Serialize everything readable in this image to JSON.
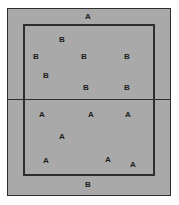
{
  "figure": {
    "background_color": "#ffffff",
    "fill_color": "#a9a9a9",
    "line_color": "#2e2e2e",
    "text_color": "#1d1d1d",
    "outer_rect": {
      "x": 7,
      "y": 8,
      "w": 164,
      "h": 188
    },
    "inner_rect": {
      "x": 23,
      "y": 24,
      "w": 132,
      "h": 152
    },
    "divider": {
      "x": 7,
      "y": 99,
      "w": 164
    }
  },
  "labels": [
    {
      "text": "A",
      "x": 88,
      "y": 17,
      "region": "outside-top"
    },
    {
      "text": "B",
      "x": 62,
      "y": 40,
      "region": "inner-upper"
    },
    {
      "text": "B",
      "x": 36,
      "y": 57,
      "region": "inner-upper"
    },
    {
      "text": "B",
      "x": 84,
      "y": 57,
      "region": "inner-upper"
    },
    {
      "text": "B",
      "x": 127,
      "y": 57,
      "region": "inner-upper"
    },
    {
      "text": "B",
      "x": 46,
      "y": 76,
      "region": "inner-upper"
    },
    {
      "text": "B",
      "x": 86,
      "y": 88,
      "region": "inner-upper"
    },
    {
      "text": "B",
      "x": 127,
      "y": 88,
      "region": "inner-upper"
    },
    {
      "text": "A",
      "x": 42,
      "y": 115,
      "region": "inner-lower"
    },
    {
      "text": "A",
      "x": 91,
      "y": 115,
      "region": "inner-lower"
    },
    {
      "text": "A",
      "x": 128,
      "y": 115,
      "region": "inner-lower"
    },
    {
      "text": "A",
      "x": 62,
      "y": 137,
      "region": "inner-lower"
    },
    {
      "text": "A",
      "x": 46,
      "y": 161,
      "region": "inner-lower"
    },
    {
      "text": "A",
      "x": 108,
      "y": 160,
      "region": "inner-lower"
    },
    {
      "text": "A",
      "x": 133,
      "y": 165,
      "region": "inner-lower"
    },
    {
      "text": "B",
      "x": 88,
      "y": 185,
      "region": "outside-bottom"
    }
  ]
}
